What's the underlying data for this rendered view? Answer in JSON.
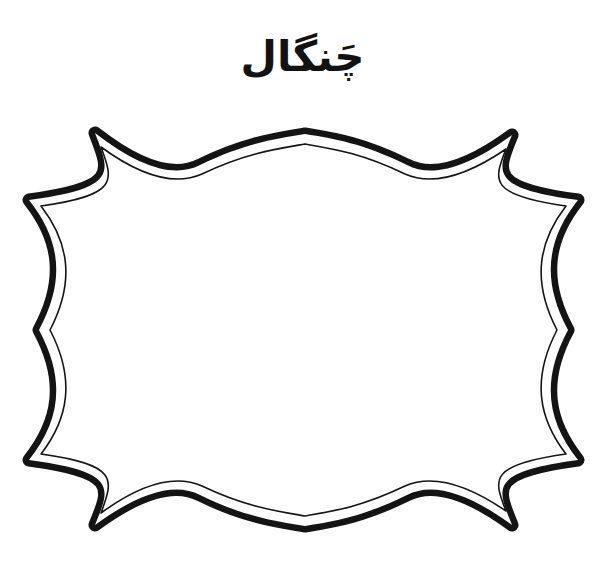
{
  "page": {
    "background_color": "#ffffff",
    "width": 605,
    "height": 561,
    "ink_color": "#141414"
  },
  "title": {
    "text": "چَنگال",
    "language": "Persian/Urdu",
    "script": "Arabic",
    "meaning": "fork",
    "color": "#121212",
    "align": "center"
  },
  "frame": {
    "name": "ornamental-bracket-frame",
    "style": "hand-drawn double-line decorative label",
    "fill_color": "#ffffff",
    "outer_stroke_color": "#141414",
    "inner_stroke_color": "#141414",
    "outer_stroke_width": 13,
    "inner_stroke_width": 1.6,
    "corner_style": "pointed-spike",
    "edge_style": "concave-curve",
    "features": [
      "top-left-spike",
      "top-center-peak",
      "top-right-spike",
      "left-middle-notch",
      "right-middle-notch",
      "bottom-left-spike",
      "bottom-center-peak",
      "bottom-right-spike"
    ],
    "interior": "blank drawing area"
  }
}
